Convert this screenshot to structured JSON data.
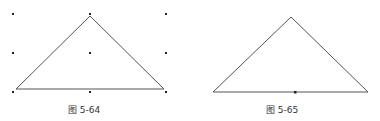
{
  "figures": [
    {
      "caption": "图 5-64",
      "grid_dots": [
        [
          13,
          14
        ],
        [
          90,
          14
        ],
        [
          166,
          14
        ],
        [
          13,
          53
        ],
        [
          90,
          53
        ],
        [
          166,
          53
        ],
        [
          13,
          92
        ],
        [
          90,
          92
        ],
        [
          166,
          92
        ]
      ],
      "triangle": [
        [
          90,
          16
        ],
        [
          16,
          89
        ],
        [
          164,
          89
        ]
      ]
    },
    {
      "caption": "图 5-65",
      "triangle": [
        [
          291,
          17
        ],
        [
          213,
          92
        ],
        [
          368,
          92
        ]
      ],
      "base_midpoint": [
        295,
        92
      ]
    }
  ],
  "colors": {
    "line": "#555555",
    "dot": "#222222"
  }
}
